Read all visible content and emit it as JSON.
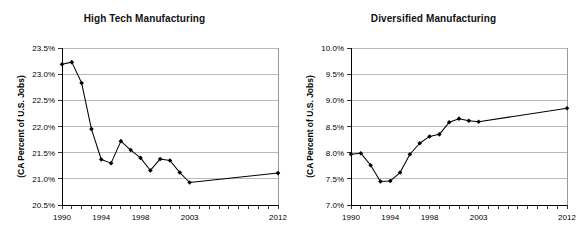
{
  "page": {
    "background_color": "#ffffff",
    "width": 578,
    "height": 236
  },
  "charts": [
    {
      "id": "high-tech-manufacturing",
      "title": "High Tech Manufacturing",
      "ylabel": "(CA Percent of U.S. Jobs)"
    },
    {
      "id": "diversified-manufacturing",
      "title": "Diversified Manufacturing",
      "ylabel": "(CA Percent of U.S. Jobs)"
    }
  ],
  "chart_data": [
    {
      "type": "line",
      "title": "High Tech Manufacturing",
      "xlabel": "",
      "ylabel": "(CA Percent of U.S. Jobs)",
      "x": [
        1990,
        1991,
        1992,
        1993,
        1994,
        1995,
        1996,
        1997,
        1998,
        1999,
        2000,
        2001,
        2002,
        2003,
        2012
      ],
      "xtick_labels": [
        "1990",
        "1994",
        "1998",
        "2003",
        "2012"
      ],
      "xtick_values": [
        1990,
        1994,
        1998,
        2003,
        2012
      ],
      "values": [
        23.19,
        23.23,
        22.83,
        21.95,
        21.37,
        21.3,
        21.72,
        21.55,
        21.4,
        21.16,
        21.38,
        21.35,
        21.12,
        20.93,
        21.11
      ],
      "ylim": [
        20.5,
        23.5
      ],
      "ytick_labels": [
        "20.5%",
        "21.0%",
        "21.5%",
        "22.0%",
        "22.5%",
        "23.0%",
        "23.5%"
      ],
      "ytick_values": [
        20.5,
        21.0,
        21.5,
        22.0,
        22.5,
        23.0,
        23.5
      ],
      "xlim": [
        1990,
        2012
      ],
      "grid": true,
      "legend": false,
      "marker": "diamond",
      "line_color": "#000000",
      "marker_color": "#000000"
    },
    {
      "type": "line",
      "title": "Diversified Manufacturing",
      "xlabel": "",
      "ylabel": "(CA Percent of U.S. Jobs)",
      "x": [
        1990,
        1991,
        1992,
        1993,
        1994,
        1995,
        1996,
        1997,
        1998,
        1999,
        2000,
        2001,
        2002,
        2003,
        2012
      ],
      "xtick_labels": [
        "1990",
        "1994",
        "1998",
        "2003",
        "2012"
      ],
      "xtick_values": [
        1990,
        1994,
        1998,
        2003,
        2012
      ],
      "values": [
        7.97,
        7.99,
        7.76,
        7.45,
        7.46,
        7.62,
        7.97,
        8.18,
        8.31,
        8.35,
        8.58,
        8.65,
        8.61,
        8.59,
        8.85
      ],
      "ylim": [
        7.0,
        10.0
      ],
      "ytick_labels": [
        "7.0%",
        "7.5%",
        "8.0%",
        "8.5%",
        "9.0%",
        "9.5%",
        "10.0%"
      ],
      "ytick_values": [
        7.0,
        7.5,
        8.0,
        8.5,
        9.0,
        9.5,
        10.0
      ],
      "xlim": [
        1990,
        2012
      ],
      "grid": true,
      "legend": false,
      "marker": "diamond",
      "line_color": "#000000",
      "marker_color": "#000000"
    }
  ]
}
